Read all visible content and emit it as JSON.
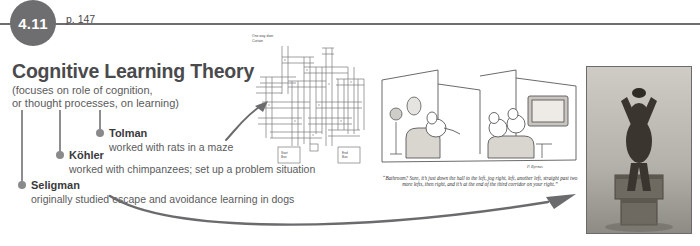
{
  "header": {
    "badge_number": "4.11",
    "page_label": "p. 147"
  },
  "concept": {
    "title": "Cognitive Learning Theory",
    "subtitle_line1": "(focuses on role of cognition,",
    "subtitle_line2": "or thought processes, on learning)"
  },
  "researchers": [
    {
      "name": "Tolman",
      "description": "worked with rats in a maze"
    },
    {
      "name": "Köhler",
      "description": "worked with chimpanzees; set up a problem situation"
    },
    {
      "name": "Seligman",
      "description": "originally studied escape and avoidance learning in dogs"
    }
  ],
  "maze": {
    "legend": {
      "one_way_door": "One-way door",
      "curtain": "Curtain"
    },
    "start_box_label": "Start Box",
    "end_box_label": "End Box"
  },
  "cartoon": {
    "caption": "“Bathroom? Sure, it’s just down the hall to the left, jog right, left, another left, straight past two more lefts, then right, and it’s at the end of the third corridor on your right.”",
    "signature": "P. Byrnes"
  },
  "photo": {
    "alt": "chimpanzee stacking boxes to reach banana"
  },
  "colors": {
    "rule": "#6e6e70",
    "badge": "#6e6e70",
    "title": "#4a4a4c",
    "dot": "#8a8a8c",
    "arrow": "#6b6b6d"
  }
}
